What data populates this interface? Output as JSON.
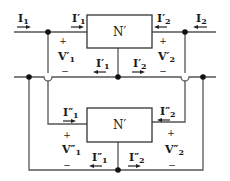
{
  "diagram": {
    "type": "two-port network parallel connection",
    "colors": {
      "wire": "#555555",
      "text": "#1a1a1a",
      "node": "#111111",
      "box_fill": "#ffffff"
    },
    "networks": {
      "top": {
        "label": "N′"
      },
      "bottom": {
        "label": "N′"
      }
    },
    "external": {
      "port1_current": {
        "main": "I",
        "sub": "1"
      },
      "port2_current": {
        "main": "I",
        "sub": "2"
      }
    },
    "top_network": {
      "in_current_1": {
        "main": "I′",
        "sub": "1"
      },
      "in_current_2": {
        "main": "I′",
        "sub": "2"
      },
      "return_current_1": {
        "main": "I′",
        "sub": "1"
      },
      "return_current_2": {
        "main": "I′",
        "sub": "2"
      },
      "voltage_1": {
        "main": "V′",
        "sub": "1",
        "plus": "+",
        "minus": "−"
      },
      "voltage_2": {
        "main": "V′",
        "sub": "2",
        "plus": "+",
        "minus": "−"
      }
    },
    "bottom_network": {
      "in_current_1": {
        "main": "I″",
        "sub": "1"
      },
      "in_current_2": {
        "main": "I″",
        "sub": "2"
      },
      "return_current_1": {
        "main": "I″",
        "sub": "1"
      },
      "return_current_2": {
        "main": "I″",
        "sub": "2"
      },
      "voltage_1": {
        "main": "V″",
        "sub": "1",
        "plus": "+",
        "minus": "−"
      },
      "voltage_2": {
        "main": "V″",
        "sub": "2",
        "plus": "+",
        "minus": "−"
      }
    }
  }
}
